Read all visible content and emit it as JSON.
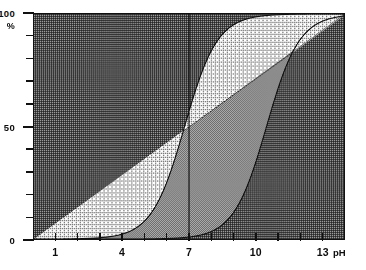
{
  "chart_data": {
    "type": "area",
    "title": "",
    "subtitle": "",
    "xlabel": "pH",
    "ylabel": "%",
    "xlim": [
      0,
      14
    ],
    "ylim": [
      0,
      100
    ],
    "grid": false,
    "legend": "none",
    "x_tick_labels": [
      "1",
      "4",
      "7",
      "10",
      "13"
    ],
    "x_tick_values": [
      1,
      4,
      7,
      10,
      13
    ],
    "x_minor_ticks": [
      1,
      2,
      3,
      4,
      5,
      6,
      7,
      8,
      9,
      10,
      11,
      12,
      13
    ],
    "y_tick_labels": [
      "0",
      "50",
      "100"
    ],
    "y_tick_values": [
      0,
      50,
      100
    ],
    "y_minor_ticks": [
      0,
      10,
      20,
      30,
      40,
      50,
      60,
      70,
      80,
      90,
      100
    ],
    "annotations": [
      {
        "name": "neutral-line",
        "x": 7,
        "label": "pH 7 neutral reference line"
      }
    ],
    "series": [
      {
        "name": "species-1-acid-form",
        "fill": "light-gray-halftone",
        "color": "#b9b9b9",
        "description": "Fraction remaining in first protonated form; sigmoid decreasing",
        "x": [
          0,
          1,
          2,
          3,
          4,
          4.5,
          5,
          5.5,
          6,
          6.4,
          6.8,
          7,
          7.2,
          7.6,
          8,
          9,
          10,
          11,
          12,
          13,
          14
        ],
        "values": [
          100,
          100,
          100,
          100,
          99,
          97,
          93,
          85,
          70,
          56,
          50,
          40,
          26,
          10,
          4,
          0,
          0,
          0,
          0,
          0,
          0
        ]
      },
      {
        "name": "species-2-intermediate-form",
        "fill": "medium-gray-halftone",
        "color": "#7e7e7e",
        "description": "Fraction in intermediate form; rises near pH 7, falls near pH 10.5",
        "x": [
          0,
          1,
          2,
          3,
          4,
          4.5,
          5,
          5.5,
          6,
          6.4,
          6.8,
          7,
          7.2,
          7.6,
          8,
          9,
          9.6,
          10,
          10.5,
          11,
          11.5,
          12,
          13,
          14
        ],
        "values": [
          0,
          0,
          0,
          0,
          1,
          3,
          7,
          15,
          30,
          44,
          50,
          60,
          74,
          90,
          96,
          95,
          82,
          70,
          50,
          26,
          10,
          4,
          0,
          0
        ]
      },
      {
        "name": "species-3-base-form",
        "fill": "dark-gray-halftone",
        "color": "#4a4a4a",
        "description": "Fraction in fully deprotonated form; sigmoid increasing around pH 10.5",
        "x": [
          0,
          1,
          2,
          3,
          4,
          5,
          6,
          7,
          8,
          9,
          9.6,
          10,
          10.5,
          11,
          11.5,
          12,
          13,
          14
        ],
        "values": [
          0,
          0,
          0,
          0,
          0,
          0,
          0,
          0,
          4,
          5,
          18,
          30,
          50,
          74,
          90,
          96,
          100,
          100
        ]
      }
    ],
    "curves": [
      {
        "name": "curve-1",
        "description": "First titration / dissociation sigmoid, midpoint pKa1",
        "midpoint_ph": 6.8,
        "steepness": 1.35
      },
      {
        "name": "curve-2",
        "description": "Second titration / dissociation sigmoid, midpoint pKa2",
        "midpoint_ph": 10.5,
        "steepness": 1.35
      }
    ],
    "colors": {
      "background": "#ffffff",
      "axis": "#111111",
      "region_acidic": "#b9b9b9",
      "region_intermediate": "#7e7e7e",
      "region_alkaline": "#4a4a4a",
      "curve_line": "#101010",
      "neutral_line": "#101010"
    }
  },
  "axes": {
    "y": {
      "label_unit": "%",
      "tick_100": "100",
      "tick_50": "50",
      "tick_0": "0"
    },
    "x": {
      "unit": "pH",
      "tick_1": "1",
      "tick_4": "4",
      "tick_7": "7",
      "tick_10": "10",
      "tick_13": "13"
    }
  }
}
